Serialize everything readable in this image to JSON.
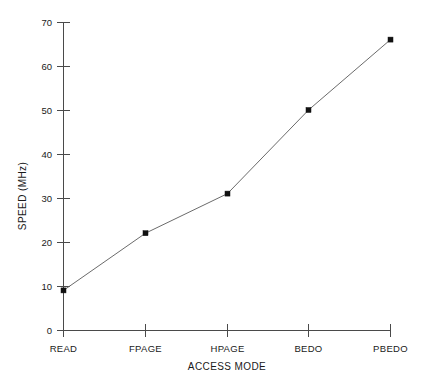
{
  "chart_data": {
    "type": "line",
    "title": "",
    "xlabel": "ACCESS MODE",
    "ylabel": "SPEED (MHz)",
    "categories": [
      "READ",
      "FPAGE",
      "HPAGE",
      "BEDO",
      "PBEDO"
    ],
    "values": [
      9,
      22,
      31,
      50,
      66
    ],
    "series": [
      {
        "name": "SPEED",
        "values": [
          9,
          22,
          31,
          50,
          66
        ]
      }
    ],
    "ylim": [
      0,
      70
    ],
    "yticks": [
      0,
      10,
      20,
      30,
      40,
      50,
      60,
      70
    ],
    "ytick_labels": [
      "0",
      "10",
      "20",
      "30",
      "40",
      "50",
      "60",
      "70"
    ],
    "grid": false,
    "legend": false,
    "marker": "filled-square",
    "line_color": "#6b6b6b",
    "marker_color": "#111111",
    "axis_color": "#4a4a4a",
    "background": "#ffffff"
  },
  "axes": {
    "y_title": "SPEED (MHz)",
    "x_title": "ACCESS MODE"
  }
}
